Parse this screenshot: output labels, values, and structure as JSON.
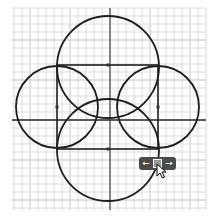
{
  "canvas": {
    "background": "#ffffff",
    "grid": {
      "x0": 12,
      "y0": 8,
      "x1": 206,
      "y1": 210,
      "step": 8,
      "minor_color": "#dcdcdc",
      "major_every": 5,
      "major_color": "#c4c4c4"
    },
    "axes": {
      "x_axis_y": 120,
      "y_axis_x": 110,
      "color": "#2b2b2b"
    },
    "stroke_color": "#1e1e1e",
    "rectangle": {
      "x": 57,
      "y": 65,
      "width": 101,
      "height": 84
    },
    "circles": [
      {
        "name": "top",
        "cx": 108,
        "cy": 67,
        "r": 51
      },
      {
        "name": "bottom",
        "cx": 108,
        "cy": 150,
        "r": 51
      },
      {
        "name": "left",
        "cx": 57,
        "cy": 107,
        "r": 41
      },
      {
        "name": "right",
        "cx": 158,
        "cy": 107,
        "r": 41
      }
    ],
    "points": [
      {
        "x": 108,
        "y": 65
      },
      {
        "x": 57,
        "y": 107
      },
      {
        "x": 158,
        "y": 107
      },
      {
        "x": 108,
        "y": 149
      }
    ]
  },
  "move_widget": {
    "left_arrow": "←",
    "right_arrow": "→",
    "x": 139,
    "y": 157,
    "color": "#4a4a4a"
  }
}
